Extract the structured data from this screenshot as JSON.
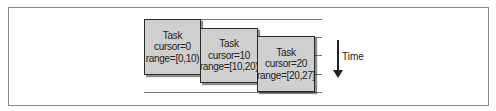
{
  "diagram": {
    "tasks": [
      {
        "title": "Task",
        "cursor": "cursor=0",
        "range": "range=[0,10)"
      },
      {
        "title": "Task",
        "cursor": "cursor=10",
        "range": "range=[10,20)"
      },
      {
        "title": "Task",
        "cursor": "cursor=20",
        "range": "range=[20,27]"
      }
    ],
    "time_label": "Time",
    "colors": {
      "box_fill": "#cfcfcf",
      "box_border": "#2a2a2a",
      "line": "#7a7a7a"
    }
  }
}
